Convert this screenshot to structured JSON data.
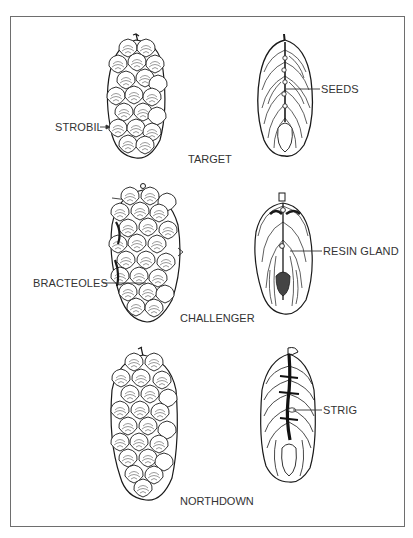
{
  "figure": {
    "colors": {
      "ink": "#1a1a1a",
      "label": "#333333",
      "border": "#6e6e6e",
      "background": "#ffffff"
    }
  },
  "varieties": [
    {
      "name": "TARGET",
      "labels": {
        "left": "STROBIL",
        "right": "SEEDS"
      },
      "left_pointer": "arrow",
      "right_pointer": "line"
    },
    {
      "name": "CHALLENGER",
      "labels": {
        "left": "BRACTEOLES",
        "right": "RESIN GLAND"
      },
      "left_pointer": "line",
      "right_pointer": "line"
    },
    {
      "name": "NORTHDOWN",
      "labels": {
        "right": "STRIG"
      },
      "right_pointer": "line"
    }
  ]
}
